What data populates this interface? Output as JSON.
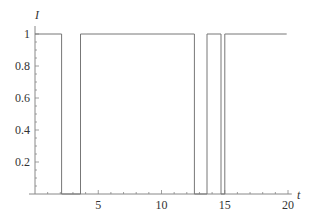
{
  "chart_data": {
    "type": "line",
    "title": "",
    "xlabel": "t",
    "ylabel": "I",
    "xlim": [
      0,
      20
    ],
    "ylim": [
      0,
      1
    ],
    "x_ticks": [
      5,
      10,
      15,
      20
    ],
    "x_tick_labels": [
      "5",
      "10",
      "15",
      "20"
    ],
    "y_ticks": [
      0.2,
      0.4,
      0.6,
      0.8,
      1
    ],
    "y_tick_labels": [
      "0.2",
      "0.4",
      "0.6",
      "0.8",
      "1"
    ],
    "grid": false,
    "legend": null,
    "series": [
      {
        "name": "I(t)",
        "step": true,
        "points": [
          [
            0,
            1
          ],
          [
            2.1,
            1
          ],
          [
            2.1,
            0
          ],
          [
            3.6,
            0
          ],
          [
            3.6,
            1
          ],
          [
            12.6,
            1
          ],
          [
            12.6,
            0
          ],
          [
            13.6,
            0
          ],
          [
            13.6,
            1
          ],
          [
            14.7,
            1
          ],
          [
            14.7,
            0
          ],
          [
            15.0,
            0
          ],
          [
            15.0,
            1
          ],
          [
            19.9,
            1
          ]
        ]
      }
    ]
  },
  "colors": {
    "line": "#777777",
    "axis": "#888888",
    "text": "#333333"
  }
}
